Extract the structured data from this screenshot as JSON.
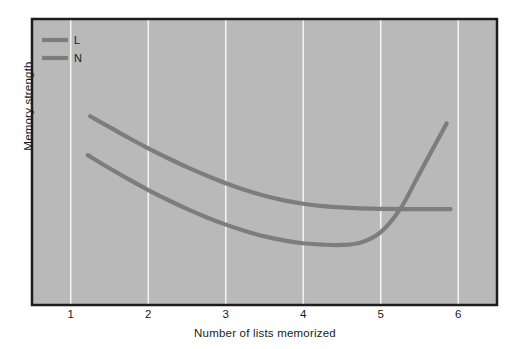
{
  "chart_data": {
    "type": "line",
    "title": "",
    "xlabel": "Number of lists memorized",
    "ylabel": "Memory strength",
    "xlim": [
      0.5,
      6.5
    ],
    "ylim": [
      0,
      100
    ],
    "xticks": [
      1,
      2,
      3,
      4,
      5,
      6
    ],
    "xtick_labels": [
      "1",
      "2",
      "3",
      "4",
      "5",
      "6"
    ],
    "yticks": [],
    "ytick_labels": [],
    "grid": "vertical-only",
    "legend_position": "top-left",
    "plot_background": "#b9b9b9",
    "grid_color": "#f2f2f2",
    "border_color": "#1c1c1c",
    "series": [
      {
        "name": "L",
        "label": "L",
        "color": "#7d7d7d",
        "x": [
          1.25,
          1.5,
          1.75,
          2.0,
          2.25,
          2.5,
          2.75,
          3.0,
          3.25,
          3.5,
          3.75,
          4.0,
          4.25,
          4.5,
          4.75,
          5.0,
          5.25,
          5.5,
          5.75,
          5.9
        ],
        "y": [
          66.0,
          62.2,
          58.4,
          54.8,
          51.4,
          48.2,
          45.3,
          42.6,
          40.2,
          38.2,
          36.6,
          35.4,
          34.6,
          34.1,
          33.8,
          33.6,
          33.5,
          33.5,
          33.5,
          33.5
        ]
      },
      {
        "name": "N",
        "label": "N",
        "color": "#7d7d7d",
        "x": [
          1.22,
          1.5,
          1.75,
          2.0,
          2.25,
          2.5,
          2.75,
          3.0,
          3.25,
          3.5,
          3.75,
          4.0,
          4.25,
          4.5,
          4.75,
          5.0,
          5.25,
          5.5,
          5.75,
          5.85
        ],
        "y": [
          52.4,
          47.8,
          43.9,
          40.2,
          36.8,
          33.6,
          30.7,
          28.1,
          25.9,
          24.0,
          22.6,
          21.6,
          21.1,
          21.0,
          21.9,
          25.5,
          33.5,
          46.0,
          58.5,
          63.5
        ]
      }
    ]
  },
  "legend": {
    "entries": [
      {
        "label": "L"
      },
      {
        "label": "N"
      }
    ]
  },
  "axes": {
    "xlabel": "Number of lists memorized",
    "ylabel": "Memory strength",
    "xtick_labels": [
      "1",
      "2",
      "3",
      "4",
      "5",
      "6"
    ]
  }
}
